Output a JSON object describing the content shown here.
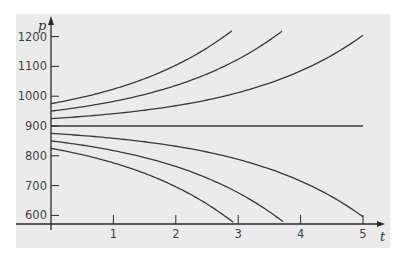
{
  "chart_data": {
    "type": "line",
    "title": "",
    "xlabel": "t",
    "ylabel": "p",
    "xlim": [
      0,
      5.3
    ],
    "ylim": [
      571,
      1260
    ],
    "grid": false,
    "legend": null,
    "x_ticks": [
      1,
      2,
      3,
      4,
      5
    ],
    "x_tick_labels": [
      "1",
      "2",
      "3",
      "4",
      "5"
    ],
    "y_ticks": [
      600,
      700,
      800,
      900,
      1000,
      1100,
      1200
    ],
    "y_tick_labels": [
      "600",
      "700",
      "800",
      "900",
      "1000",
      "1100",
      "1200"
    ],
    "model": "p = 900 + c * exp(t/2)",
    "equilibrium": 900,
    "series": [
      {
        "name": "p0=975",
        "c": 75,
        "t_end": 2.9,
        "points": [
          [
            0,
            975
          ],
          [
            1,
            1024
          ],
          [
            2,
            1104
          ],
          [
            2.9,
            1222
          ]
        ]
      },
      {
        "name": "p0=950",
        "c": 50,
        "t_end": 3.7,
        "points": [
          [
            0,
            950
          ],
          [
            1,
            982
          ],
          [
            2,
            1036
          ],
          [
            3,
            1124
          ],
          [
            3.7,
            1218
          ]
        ]
      },
      {
        "name": "p0=925",
        "c": 25,
        "t_end": 5.0,
        "points": [
          [
            0,
            925
          ],
          [
            1,
            941
          ],
          [
            2,
            968
          ],
          [
            3,
            1012
          ],
          [
            4,
            1085
          ],
          [
            5,
            1205
          ]
        ]
      },
      {
        "name": "p0=900",
        "c": 0,
        "t_end": 5.0,
        "points": [
          [
            0,
            900
          ],
          [
            5,
            900
          ]
        ]
      },
      {
        "name": "p0=875",
        "c": -25,
        "t_end": 5.0,
        "points": [
          [
            0,
            875
          ],
          [
            1,
            859
          ],
          [
            2,
            832
          ],
          [
            3,
            788
          ],
          [
            4,
            715
          ],
          [
            5,
            595
          ]
        ]
      },
      {
        "name": "p0=850",
        "c": -50,
        "t_end": 3.72,
        "points": [
          [
            0,
            850
          ],
          [
            1,
            818
          ],
          [
            2,
            764
          ],
          [
            3,
            676
          ],
          [
            3.72,
            571
          ]
        ]
      },
      {
        "name": "p0=825",
        "c": -75,
        "t_end": 2.92,
        "points": [
          [
            0,
            825
          ],
          [
            1,
            776
          ],
          [
            2,
            696
          ],
          [
            2.92,
            571
          ]
        ]
      }
    ]
  },
  "colors": {
    "panel": "#ebebeb",
    "curve": "#3a3a3a",
    "axis": "#2a2a2a"
  }
}
